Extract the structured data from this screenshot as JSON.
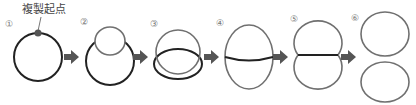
{
  "diagram": {
    "origin_label": "複製起点",
    "steps": [
      {
        "number": "①"
      },
      {
        "number": "②"
      },
      {
        "number": "③"
      },
      {
        "number": "④"
      },
      {
        "number": "⑤"
      },
      {
        "number": "⑥"
      }
    ],
    "colors": {
      "parent_strand": "#222222",
      "new_strand": "#707070",
      "arrow": "#555555",
      "origin_dot": "#555555"
    }
  }
}
